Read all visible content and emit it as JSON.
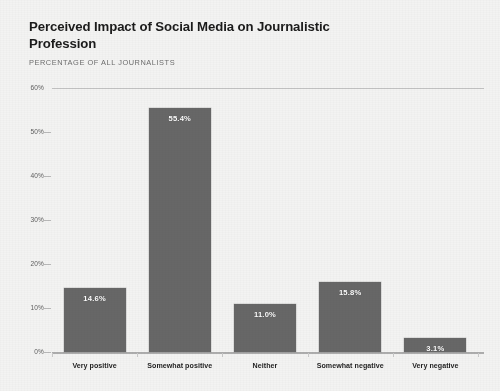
{
  "header": {
    "title": "Perceived Impact of Social Media on Journalistic Profession",
    "subtitle": "PERCENTAGE OF ALL JOURNALISTS"
  },
  "colors": {
    "bar": "#676767",
    "background": "#f3f3f2",
    "title_text": "#1b1b1b",
    "subtitle_text": "#6e6e6e",
    "axis_text": "#5d5d5d",
    "gridline": "#c3c3c3",
    "bar_label_text": "#ffffff"
  },
  "chart_data": {
    "type": "bar",
    "title": "Perceived Impact of Social Media on Journalistic Profession",
    "subtitle": "PERCENTAGE OF ALL JOURNALISTS",
    "xlabel": "",
    "ylabel": "",
    "categories": [
      "Very positive",
      "Somewhat positive",
      "Neither",
      "Somewhat negative",
      "Very negative"
    ],
    "values": [
      14.6,
      55.4,
      11.0,
      15.8,
      3.1
    ],
    "data_labels": [
      "14.6%",
      "55.4%",
      "11.0%",
      "15.8%",
      "3.1%"
    ],
    "ylim": [
      0,
      60
    ],
    "ytick_values": [
      0,
      10,
      20,
      30,
      40,
      50,
      60
    ],
    "ytick_labels": [
      "0%",
      "10%",
      "20%",
      "30%",
      "40%",
      "50%",
      "60%"
    ],
    "grid": false,
    "top_rule_at": 60,
    "legend": null,
    "legend_position": "none",
    "units": "percent",
    "orientation": "vertical"
  }
}
